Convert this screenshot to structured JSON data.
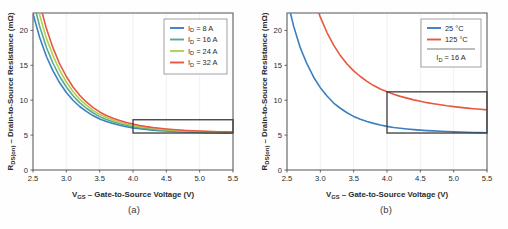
{
  "figure": {
    "background": "#fefefe",
    "frame_color": "#555555",
    "grid_color": "#e8e8e8",
    "highlight_box_color": "#3b3b3b"
  },
  "panels": [
    {
      "caption": "(a)",
      "axis": {
        "x_title_main": "V",
        "x_title_sub": "GS",
        "x_title_rest": " – Gate-to-Source Voltage (V)",
        "y_title_main": "R",
        "y_title_sub": "DS(on)",
        "y_title_rest": " – Drain-to-Source Resistance (mΩ)",
        "x_ticks": [
          "2.5",
          "3.0",
          "3.5",
          "4.0",
          "4.5",
          "5.0",
          "5.5"
        ],
        "y_ticks": [
          "0",
          "5",
          "10",
          "15",
          "20"
        ]
      },
      "legend": {
        "entries": [
          {
            "label_main": "I",
            "label_sub": "D",
            "label_rest": " = 8 A",
            "color": "#3b7fc4"
          },
          {
            "label_main": "I",
            "label_sub": "D",
            "label_rest": " = 16 A",
            "color": "#57ab8e"
          },
          {
            "label_main": "I",
            "label_sub": "D",
            "label_rest": " = 24 A",
            "color": "#b2cf4e"
          },
          {
            "label_main": "I",
            "label_sub": "D",
            "label_rest": " = 32 A",
            "color": "#e8573f"
          }
        ],
        "note_main": null,
        "note_sub": null,
        "note_rest": null
      },
      "highlight_box": {
        "x0": 4.0,
        "x1": 5.5,
        "y0": 5.3,
        "y1": 7.2
      }
    },
    {
      "caption": "(b)",
      "axis": {
        "x_title_main": "V",
        "x_title_sub": "GS",
        "x_title_rest": " – Gate-to-Source Voltage (V)",
        "y_title_main": "R",
        "y_title_sub": "DS(on)",
        "y_title_rest": " – Drain-to-Source Resistance (mΩ)",
        "x_ticks": [
          "2.5",
          "3.0",
          "3.5",
          "4.0",
          "4.5",
          "5.0",
          "5.5"
        ],
        "y_ticks": [
          "0",
          "5",
          "10",
          "15",
          "20"
        ]
      },
      "legend": {
        "entries": [
          {
            "label_main": "25 °C",
            "label_sub": "",
            "label_rest": "",
            "color": "#3b7fc4"
          },
          {
            "label_main": "125 °C",
            "label_sub": "",
            "label_rest": "",
            "color": "#e8573f"
          }
        ],
        "note_main": "I",
        "note_sub": "D",
        "note_rest": " = 16 A"
      },
      "highlight_box": {
        "x0": 4.0,
        "x1": 5.5,
        "y0": 5.3,
        "y1": 11.2
      }
    }
  ],
  "chart_data": [
    {
      "type": "line",
      "title": "",
      "xlabel": "VGS – Gate-to-Source Voltage (V)",
      "ylabel": "RDS(on) – Drain-to-Source Resistance (mΩ)",
      "xlim": [
        2.5,
        5.5
      ],
      "ylim": [
        0,
        22.5
      ],
      "xticks": [
        2.5,
        3.0,
        3.5,
        4.0,
        4.5,
        5.0,
        5.5
      ],
      "yticks": [
        0,
        5,
        10,
        15,
        20
      ],
      "grid": true,
      "legend_position": "upper-right",
      "annotation_box": {
        "x": [
          4.0,
          5.5
        ],
        "y": [
          5.3,
          7.2
        ]
      },
      "x": [
        2.5,
        2.6,
        2.7,
        2.8,
        2.9,
        3.0,
        3.1,
        3.2,
        3.3,
        3.4,
        3.5,
        3.6,
        3.7,
        3.8,
        3.9,
        4.0,
        4.1,
        4.2,
        4.3,
        4.4,
        4.5,
        4.6,
        4.7,
        4.8,
        4.9,
        5.0,
        5.1,
        5.2,
        5.3,
        5.4,
        5.5
      ],
      "series": [
        {
          "name": "ID = 8 A",
          "color": "#3b7fc4",
          "values": [
            22.4,
            19.0,
            16.3,
            14.2,
            12.5,
            11.1,
            10.0,
            9.1,
            8.4,
            7.8,
            7.3,
            6.95,
            6.65,
            6.4,
            6.2,
            6.02,
            5.9,
            5.8,
            5.71,
            5.64,
            5.58,
            5.53,
            5.49,
            5.45,
            5.42,
            5.39,
            5.36,
            5.34,
            5.32,
            5.31,
            5.3
          ]
        },
        {
          "name": "ID = 16 A",
          "color": "#57ab8e",
          "values": [
            24.3,
            20.6,
            17.6,
            15.3,
            13.4,
            11.9,
            10.65,
            9.65,
            8.85,
            8.2,
            7.65,
            7.25,
            6.9,
            6.62,
            6.4,
            6.2,
            6.05,
            5.93,
            5.83,
            5.74,
            5.67,
            5.61,
            5.56,
            5.52,
            5.48,
            5.45,
            5.42,
            5.4,
            5.38,
            5.36,
            5.35
          ]
        },
        {
          "name": "ID = 24 A",
          "color": "#b2cf4e",
          "values": [
            26.2,
            22.2,
            18.9,
            16.4,
            14.3,
            12.6,
            11.25,
            10.15,
            9.3,
            8.55,
            7.98,
            7.52,
            7.15,
            6.85,
            6.6,
            6.4,
            6.22,
            6.08,
            5.96,
            5.86,
            5.78,
            5.71,
            5.65,
            5.6,
            5.55,
            5.51,
            5.48,
            5.45,
            5.43,
            5.41,
            5.4
          ]
        },
        {
          "name": "ID = 32 A",
          "color": "#e8573f",
          "values": [
            28.4,
            23.9,
            20.3,
            17.5,
            15.2,
            13.4,
            11.9,
            10.7,
            9.75,
            8.95,
            8.32,
            7.82,
            7.42,
            7.08,
            6.8,
            6.58,
            6.38,
            6.22,
            6.09,
            5.98,
            5.88,
            5.8,
            5.73,
            5.67,
            5.62,
            5.58,
            5.54,
            5.51,
            5.48,
            5.46,
            5.45
          ]
        }
      ]
    },
    {
      "type": "line",
      "title": "",
      "xlabel": "VGS – Gate-to-Source Voltage (V)",
      "ylabel": "RDS(on) – Drain-to-Source Resistance (mΩ)",
      "xlim": [
        2.5,
        5.5
      ],
      "ylim": [
        0,
        22.5
      ],
      "xticks": [
        2.5,
        3.0,
        3.5,
        4.0,
        4.5,
        5.0,
        5.5
      ],
      "yticks": [
        0,
        5,
        10,
        15,
        20
      ],
      "grid": true,
      "legend_position": "upper-right",
      "annotation_box": {
        "x": [
          4.0,
          5.5
        ],
        "y": [
          5.3,
          11.2
        ]
      },
      "x": [
        2.5,
        2.6,
        2.7,
        2.8,
        2.9,
        3.0,
        3.1,
        3.2,
        3.3,
        3.4,
        3.5,
        3.6,
        3.7,
        3.8,
        3.9,
        4.0,
        4.1,
        4.2,
        4.3,
        4.4,
        4.5,
        4.6,
        4.7,
        4.8,
        4.9,
        5.0,
        5.1,
        5.2,
        5.3,
        5.4,
        5.5
      ],
      "series": [
        {
          "name": "25 °C",
          "color": "#3b7fc4",
          "values": [
            24.5,
            20.6,
            17.5,
            15.2,
            13.3,
            11.8,
            10.6,
            9.6,
            8.85,
            8.2,
            7.68,
            7.28,
            6.95,
            6.68,
            6.45,
            6.25,
            6.1,
            5.98,
            5.88,
            5.79,
            5.71,
            5.65,
            5.6,
            5.55,
            5.51,
            5.47,
            5.44,
            5.41,
            5.38,
            5.36,
            5.34
          ]
        },
        {
          "name": "125 °C",
          "color": "#e8573f",
          "values": [
            45.0,
            38.0,
            32.5,
            28.2,
            24.7,
            21.9,
            19.7,
            17.9,
            16.4,
            15.2,
            14.2,
            13.4,
            12.7,
            12.1,
            11.6,
            11.2,
            10.85,
            10.55,
            10.3,
            10.05,
            9.85,
            9.65,
            9.5,
            9.35,
            9.2,
            9.08,
            8.97,
            8.87,
            8.78,
            8.7,
            8.62
          ]
        }
      ]
    }
  ]
}
